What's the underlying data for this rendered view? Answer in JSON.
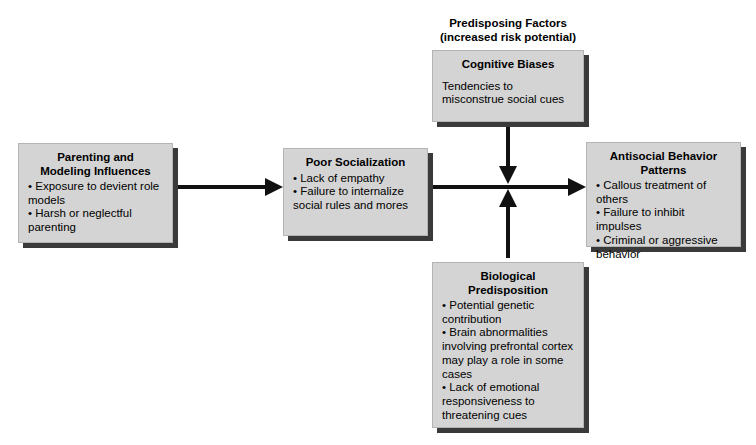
{
  "diagram": {
    "heading": {
      "line1": "Predisposing Factors",
      "line2": "(increased risk potential)"
    },
    "boxes": {
      "parenting": {
        "title_line1": "Parenting and",
        "title_line2": "Modeling Influences",
        "bullets": [
          "• Exposure to devient role models",
          "• Harsh or neglectful parenting"
        ]
      },
      "socialization": {
        "title": "Poor Socialization",
        "bullets": [
          "• Lack of empathy",
          "• Failure to internalize social rules and mores"
        ]
      },
      "antisocial": {
        "title_line1": "Antisocial Behavior",
        "title_line2": "Patterns",
        "bullets": [
          "• Callous treatment of others",
          "• Failure to inhibit impulses",
          "• Criminal or aggressive behavior"
        ]
      },
      "cognitive": {
        "title": "Cognitive Biases",
        "body_line1": "Tendencies to",
        "body_line2": "misconstrue social cues"
      },
      "biological": {
        "title_line1": "Biological",
        "title_line2": "Predisposition",
        "bullets": [
          "• Potential genetic contribution",
          "• Brain abnormalities involving prefrontal cortex may play a role in some cases",
          "• Lack of emotional responsiveness to threatening cues"
        ]
      }
    },
    "colors": {
      "box_fill": "#d4d4d4",
      "box_shadow": "#3a3a3a",
      "arrow": "#111111",
      "background": "#ffffff",
      "text": "#000000"
    }
  }
}
